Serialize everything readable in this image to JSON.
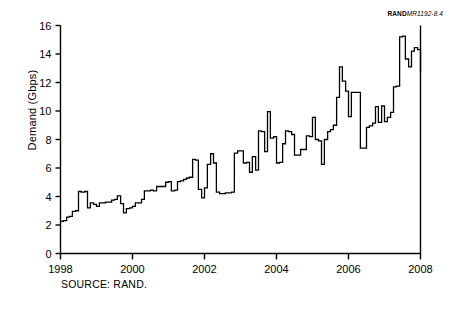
{
  "figure": {
    "rand_label": "RAND",
    "rand_number": "MR1192-8.4",
    "source_note": "SOURCE: RAND."
  },
  "chart_data": {
    "type": "line",
    "title": "",
    "subtitle": "",
    "xlabel": "",
    "ylabel": "Demand (Gbps)",
    "xlim": [
      1998,
      2008
    ],
    "ylim": [
      0,
      16
    ],
    "xticks": [
      1998,
      2000,
      2002,
      2004,
      2006,
      2008
    ],
    "xticklabels": [
      "1998",
      "2000",
      "2002",
      "2004",
      "2006",
      "2008"
    ],
    "yticks": [
      0,
      2,
      4,
      6,
      8,
      10,
      12,
      14,
      16
    ],
    "yticklabels": [
      "0",
      "2",
      "4",
      "6",
      "8",
      "10",
      "12",
      "14",
      "16"
    ],
    "grid": false,
    "legend": false,
    "line_color": "#000000",
    "line_width": 1.3,
    "series": [
      {
        "name": "Demand",
        "x": [
          1998.0,
          1998.08,
          1998.17,
          1998.25,
          1998.33,
          1998.42,
          1998.5,
          1998.58,
          1998.67,
          1998.75,
          1998.83,
          1998.92,
          1999.0,
          1999.08,
          1999.17,
          1999.25,
          1999.33,
          1999.42,
          1999.5,
          1999.58,
          1999.67,
          1999.75,
          1999.83,
          1999.92,
          2000.0,
          2000.08,
          2000.17,
          2000.25,
          2000.33,
          2000.42,
          2000.5,
          2000.58,
          2000.67,
          2000.75,
          2000.83,
          2000.92,
          2001.0,
          2001.08,
          2001.17,
          2001.25,
          2001.33,
          2001.42,
          2001.5,
          2001.58,
          2001.67,
          2001.75,
          2001.83,
          2001.92,
          2002.0,
          2002.08,
          2002.17,
          2002.25,
          2002.33,
          2002.42,
          2002.5,
          2002.58,
          2002.67,
          2002.75,
          2002.83,
          2002.92,
          2003.0,
          2003.08,
          2003.17,
          2003.25,
          2003.33,
          2003.42,
          2003.5,
          2003.58,
          2003.67,
          2003.75,
          2003.83,
          2003.92,
          2004.0,
          2004.08,
          2004.17,
          2004.25,
          2004.33,
          2004.42,
          2004.5,
          2004.58,
          2004.67,
          2004.75,
          2004.83,
          2004.92,
          2005.0,
          2005.08,
          2005.17,
          2005.25,
          2005.33,
          2005.42,
          2005.5,
          2005.58,
          2005.67,
          2005.75,
          2005.83,
          2005.92,
          2006.0,
          2006.08,
          2006.17,
          2006.25,
          2006.33,
          2006.42,
          2006.5,
          2006.58,
          2006.67,
          2006.75,
          2006.83,
          2006.92,
          2007.0,
          2007.08,
          2007.17,
          2007.25,
          2007.33,
          2007.42,
          2007.5,
          2007.58,
          2007.67,
          2007.75,
          2007.83,
          2007.92,
          2008.0
        ],
        "values": [
          2.25,
          2.3,
          2.55,
          2.6,
          2.95,
          3.0,
          4.35,
          4.3,
          4.35,
          3.2,
          3.55,
          3.45,
          3.3,
          3.55,
          3.55,
          3.6,
          3.6,
          3.75,
          3.8,
          4.05,
          3.5,
          2.85,
          3.15,
          3.2,
          3.3,
          3.55,
          3.55,
          3.8,
          4.4,
          4.4,
          4.45,
          4.4,
          4.7,
          4.7,
          4.7,
          5.0,
          5.05,
          4.4,
          4.45,
          5.05,
          5.1,
          5.2,
          5.3,
          5.35,
          6.6,
          6.55,
          4.5,
          3.9,
          4.6,
          6.25,
          7.0,
          6.35,
          4.3,
          4.2,
          4.2,
          4.25,
          4.25,
          4.3,
          7.05,
          7.2,
          7.2,
          6.35,
          6.4,
          5.7,
          6.8,
          5.85,
          8.6,
          8.55,
          7.15,
          9.95,
          8.1,
          8.2,
          6.35,
          6.4,
          7.7,
          8.6,
          8.55,
          8.35,
          6.9,
          6.9,
          7.3,
          7.3,
          8.25,
          8.2,
          9.55,
          8.0,
          7.9,
          6.25,
          8.0,
          8.55,
          8.7,
          9.0,
          10.95,
          13.1,
          12.1,
          11.4,
          9.6,
          11.3,
          11.3,
          11.3,
          7.4,
          7.4,
          8.85,
          8.95,
          9.15,
          10.3,
          9.2,
          10.35,
          9.25,
          9.55,
          9.9,
          11.7,
          11.75,
          15.2,
          15.25,
          13.65,
          13.1,
          14.2,
          14.45,
          14.3,
          12.75
        ]
      }
    ]
  }
}
